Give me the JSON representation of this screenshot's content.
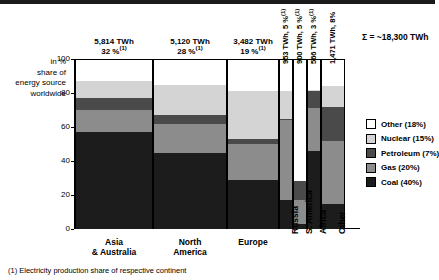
{
  "header": {
    "rule": true
  },
  "axis": {
    "caption": "in  %\nshare of\nenergy source\nworldwide",
    "caption_lines": [
      "in  %",
      "share of",
      "energy source",
      "worldwide"
    ],
    "yticks": [
      "100",
      "80",
      "60",
      "40",
      "20",
      "0"
    ]
  },
  "total": {
    "label": "Σ = ~18,300 TWh"
  },
  "footnote": {
    "text": "(1) Electricity production share of respective continent"
  },
  "legend": {
    "items": [
      {
        "label": "Other (18%)",
        "key": "other",
        "color": "#ffffff"
      },
      {
        "label": "Nuclear (15%)",
        "key": "nuclear",
        "color": "#d4d4d4"
      },
      {
        "label": "Petroleum (7%)",
        "key": "petroleum",
        "color": "#4a4a4a"
      },
      {
        "label": "Gas (20%)",
        "key": "gas",
        "color": "#8c8c8c"
      },
      {
        "label": "Coal (40%)",
        "key": "coal",
        "color": "#1c1c1c"
      }
    ]
  },
  "chart_data": {
    "type": "bar",
    "subtype": "stacked-100-percent-variable-width",
    "title": "",
    "xlabel": "",
    "ylabel": "in % share of energy source worldwide",
    "ylim": [
      0,
      100
    ],
    "yticks": [
      0,
      20,
      40,
      60,
      80,
      100
    ],
    "grid": false,
    "legend_position": "right",
    "stack_order_bottom_to_top": [
      "coal",
      "gas",
      "petroleum",
      "nuclear",
      "other"
    ],
    "series": [
      {
        "name": "Coal",
        "color": "#1c1c1c",
        "share_worldwide_pct": 40,
        "values": [
          57,
          45,
          29,
          17,
          3,
          46,
          15
        ]
      },
      {
        "name": "Gas",
        "color": "#8c8c8c",
        "share_worldwide_pct": 20,
        "values": [
          13,
          17,
          21,
          47,
          14,
          25,
          37
        ]
      },
      {
        "name": "Petroleum",
        "color": "#4a4a4a",
        "share_worldwide_pct": 7,
        "values": [
          7,
          5,
          3,
          1,
          11,
          10,
          20
        ]
      },
      {
        "name": "Nuclear",
        "color": "#d4d4d4",
        "share_worldwide_pct": 15,
        "values": [
          10,
          18,
          28,
          16,
          0,
          1,
          12
        ]
      },
      {
        "name": "Other",
        "color": "#ffffff",
        "share_worldwide_pct": 18,
        "values": [
          13,
          15,
          19,
          19,
          72,
          18,
          16
        ]
      }
    ],
    "categories": [
      {
        "label_lines": [
          "Asia",
          "& Australia"
        ],
        "rotated": false,
        "twh": "5,814 TWh",
        "pct": "32 %",
        "footnote_marker": "(1)",
        "top_label_lines": [
          "5,814 TWh",
          "32 %(1)"
        ],
        "width_px": 78,
        "left_px": 1,
        "segments": {
          "coal": 57,
          "gas": 13,
          "petroleum": 7,
          "nuclear": 10,
          "other": 13
        }
      },
      {
        "label_lines": [
          "North",
          "America"
        ],
        "rotated": false,
        "twh": "5,120 TWh",
        "pct": "28 %",
        "footnote_marker": "(1)",
        "top_label_lines": [
          "5,120 TWh",
          "28 %(1)"
        ],
        "width_px": 74,
        "left_px": 79,
        "segments": {
          "coal": 45,
          "gas": 17,
          "petroleum": 5,
          "nuclear": 18,
          "other": 15
        }
      },
      {
        "label_lines": [
          "Europe"
        ],
        "rotated": false,
        "twh": "3,482 TWh",
        "pct": "19 %",
        "footnote_marker": "(1)",
        "top_label_lines": [
          "3,482 TWh",
          "19 %(1)"
        ],
        "width_px": 52,
        "left_px": 153,
        "segments": {
          "coal": 29,
          "gas": 21,
          "petroleum": 3,
          "nuclear": 28,
          "other": 19
        }
      },
      {
        "label_lines": [
          "Russia"
        ],
        "rotated": true,
        "twh": "953 TWh",
        "pct": "5 %",
        "footnote_marker": "(1)",
        "top_label_rot": "953 TWh, 5 %(1)",
        "width_px": 14,
        "left_px": 205,
        "segments": {
          "coal": 17,
          "gas": 47,
          "petroleum": 1,
          "nuclear": 16,
          "other": 19
        }
      },
      {
        "label_lines": [
          "S. America"
        ],
        "rotated": true,
        "twh": "900 TWh",
        "pct": "5 %",
        "footnote_marker": "(1)",
        "top_label_rot": "900 TWh, 5 %(1)",
        "width_px": 14,
        "left_px": 219,
        "segments": {
          "coal": 3,
          "gas": 14,
          "petroleum": 11,
          "nuclear": 0,
          "other": 72
        }
      },
      {
        "label_lines": [
          "Africa"
        ],
        "rotated": true,
        "twh": "566 TWh",
        "pct": "3 %",
        "footnote_marker": "(1)",
        "top_label_rot": "566 TWh, 3 %(1)",
        "width_px": 14,
        "left_px": 233,
        "segments": {
          "coal": 46,
          "gas": 25,
          "petroleum": 10,
          "nuclear": 1,
          "other": 18
        }
      },
      {
        "label_lines": [
          "Other"
        ],
        "rotated": true,
        "twh": "1,471 TWh",
        "pct": "8 %",
        "footnote_marker": "",
        "top_label_rot": "1,471 TWh, 8%",
        "width_px": 24,
        "left_px": 247,
        "segments": {
          "coal": 15,
          "gas": 37,
          "petroleum": 20,
          "nuclear": 12,
          "other": 16
        }
      }
    ],
    "total_label": "Σ = ~18,300 TWh",
    "annotations": [
      "(1) Electricity production share of respective continent"
    ]
  }
}
